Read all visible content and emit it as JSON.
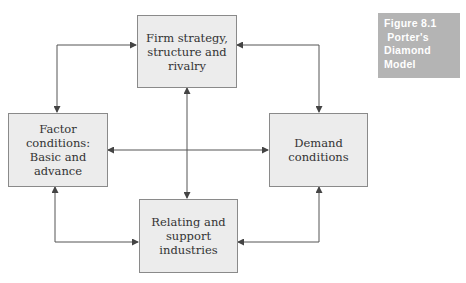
{
  "figure": {
    "label_lines": [
      "Figure 8.1",
      " Porter's",
      "Diamond",
      "Model"
    ],
    "colors": {
      "label_bg": "#b4b4b4",
      "box_bg": "#ececec",
      "box_border": "#8a8a8a",
      "arrow": "#444444"
    }
  },
  "nodes": {
    "firm": {
      "line1": "Firm strategy,",
      "line2": "structure and",
      "line3": "rivalry"
    },
    "factor": {
      "line1": "Factor conditions:",
      "line2": "Basic and advance"
    },
    "demand": {
      "line1": "Demand conditions"
    },
    "relating": {
      "line1": "Relating and",
      "line2": "support industries"
    }
  },
  "edges": [
    {
      "from": "firm",
      "to": "factor",
      "type": "bidirectional"
    },
    {
      "from": "firm",
      "to": "demand",
      "type": "bidirectional"
    },
    {
      "from": "firm",
      "to": "relating",
      "type": "bidirectional"
    },
    {
      "from": "factor",
      "to": "demand",
      "type": "bidirectional"
    },
    {
      "from": "factor",
      "to": "relating",
      "type": "bidirectional"
    },
    {
      "from": "demand",
      "to": "relating",
      "type": "bidirectional"
    }
  ]
}
